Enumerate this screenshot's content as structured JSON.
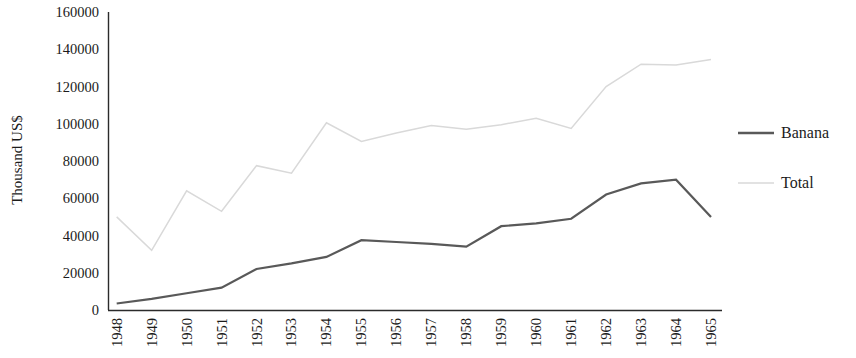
{
  "chart_data": {
    "type": "line",
    "title": "",
    "xlabel": "",
    "ylabel": "Thousand US$",
    "ylim": [
      0,
      160000
    ],
    "ytick_step": 20000,
    "yticks": [
      "0",
      "20000",
      "40000",
      "60000",
      "80000",
      "100000",
      "120000",
      "140000",
      "160000"
    ],
    "grid": false,
    "legend_position": "right",
    "categories": [
      "1948",
      "1949",
      "1950",
      "1951",
      "1952",
      "1953",
      "1954",
      "1955",
      "1956",
      "1957",
      "1958",
      "1959",
      "1960",
      "1961",
      "1962",
      "1963",
      "1964",
      "1965"
    ],
    "series": [
      {
        "name": "Banana",
        "color": "#595959",
        "values": [
          3500,
          6000,
          9000,
          12000,
          22000,
          25000,
          28500,
          37500,
          36500,
          35500,
          34000,
          45000,
          46500,
          49000,
          62000,
          68000,
          70000,
          50000
        ]
      },
      {
        "name": "Total",
        "color": "#d9d9d9",
        "values": [
          50000,
          32000,
          64000,
          53000,
          77500,
          73500,
          100500,
          90500,
          95000,
          99000,
          97000,
          99500,
          103000,
          97500,
          120000,
          132000,
          131500,
          134500
        ]
      }
    ]
  },
  "legend": {
    "items": [
      {
        "label": "Banana",
        "color": "#595959"
      },
      {
        "label": "Total",
        "color": "#d9d9d9"
      }
    ]
  },
  "axis": {
    "y_title": "Thousand US$"
  },
  "colors": {
    "banana": "#595959",
    "total": "#d9d9d9",
    "axis": "#2b2b2b",
    "text": "#1b1b1b",
    "background": "#ffffff"
  }
}
